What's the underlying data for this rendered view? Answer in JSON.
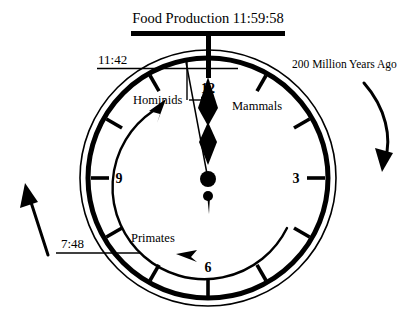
{
  "figure": {
    "type": "evolutionary-clock-diagram",
    "background_color": "#ffffff",
    "ink_color": "#000000"
  },
  "header": {
    "title": "Food Production 11:59:58",
    "bar_name": "header-rule"
  },
  "annotations": {
    "top_left_time": "11:42",
    "bottom_left_time": "7:48",
    "right_caption": "200 Million Years Ago",
    "hominids": "Hominids",
    "mammals": "Mammals",
    "primates": "Primates"
  },
  "clock": {
    "hour_numerals": [
      {
        "label": "12",
        "position": "top"
      },
      {
        "label": "3",
        "position": "right"
      },
      {
        "label": "6",
        "position": "bottom"
      },
      {
        "label": "9",
        "position": "left"
      }
    ],
    "tick_count": 12,
    "hands": {
      "pointing_to": "12",
      "style": "spade-and-diamond",
      "second_hand": "thin-needle"
    },
    "inner_arrow_arc": {
      "direction": "counterclockwise",
      "start": "7:30",
      "end": "11:00"
    },
    "outer_arrow_right": {
      "direction": "clockwise-down",
      "name": "time-direction-arrow-right"
    },
    "outer_arrow_left": {
      "direction": "upward",
      "name": "time-direction-arrow-left"
    }
  }
}
